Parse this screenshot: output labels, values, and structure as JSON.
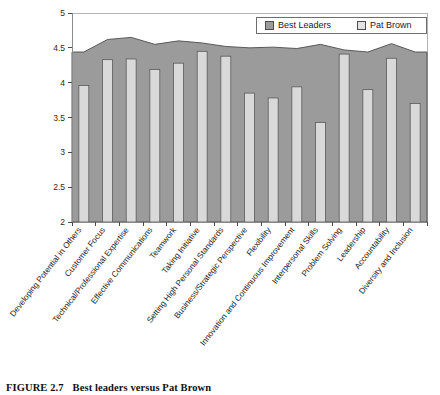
{
  "figure": {
    "caption_number": "FIGURE 2.7",
    "caption_text": "Best leaders versus Pat Brown"
  },
  "legend": {
    "position": "top-right",
    "entries": [
      {
        "label": "Best Leaders",
        "color": "#9b9b9b",
        "swatch": "dark-gray-swatch"
      },
      {
        "label": "Pat Brown",
        "color": "#e2e2e2",
        "swatch": "light-gray-swatch"
      }
    ]
  },
  "chart_data": {
    "type": "bar",
    "title": "Best leaders versus Pat Brown",
    "xlabel": "",
    "ylabel": "",
    "ylim": [
      2,
      5
    ],
    "yticks": [
      2,
      2.5,
      3,
      3.5,
      4,
      4.5,
      5
    ],
    "ytick_labels": [
      "2",
      "2.5",
      "3",
      "3.5",
      "4",
      "4.5",
      "5"
    ],
    "grid": false,
    "categories": [
      "Developing Potential in Others",
      "Customer Focus",
      "Technical/Professional Expertise",
      "Effective Communications",
      "Teamwork",
      "Taking Initiative",
      "Setting High Personal Standards",
      "Business/Strategic Perspective",
      "Flexibility",
      "Innovation and Continuous Improvement",
      "Interpersonal Skills",
      "Problem Solving",
      "Leadership",
      "Accountability",
      "Diversity and Inclusion"
    ],
    "series": [
      {
        "name": "Best Leaders",
        "render": "area",
        "color": "#9b9b9b",
        "values": [
          4.44,
          4.62,
          4.65,
          4.55,
          4.6,
          4.57,
          4.52,
          4.5,
          4.51,
          4.49,
          4.55,
          4.47,
          4.44,
          4.56,
          4.44
        ]
      },
      {
        "name": "Pat Brown",
        "render": "bar",
        "color": "#d9d9d9",
        "values": [
          3.96,
          4.33,
          4.34,
          4.19,
          4.28,
          4.45,
          4.38,
          3.85,
          3.78,
          3.94,
          3.43,
          4.41,
          3.9,
          4.35,
          3.7
        ]
      }
    ]
  },
  "axes": {
    "y_min_label": "2",
    "y_max_label": "5"
  }
}
